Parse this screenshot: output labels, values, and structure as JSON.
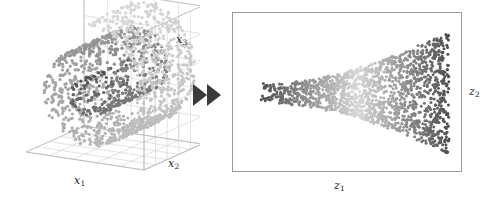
{
  "figure": {
    "caption": "",
    "background_color": "#ffffff",
    "width": 497,
    "height": 204
  },
  "left_panel": {
    "name": "swiss-roll-3d-scatter",
    "projection": "3d",
    "box_color": "#b9b9b9",
    "grid_color": "#cfcfcf",
    "axis_labels": {
      "x1": "x",
      "x1_sub": "1",
      "x2": "x",
      "x2_sub": "2",
      "x3": "x",
      "x3_sub": "3"
    }
  },
  "transition": {
    "name": "double-right-arrow",
    "glyph": "▶▶",
    "color": "#3a3a3a"
  },
  "right_panel": {
    "name": "unrolled-embedding-2d",
    "projection": "2d",
    "frame_color": "#9a9a9a",
    "axis_labels": {
      "z1": "z",
      "z1_sub": "1",
      "z2": "z",
      "z2_sub": "2"
    }
  },
  "chart_data": [
    {
      "id": "swiss-roll-3d",
      "type": "scatter",
      "title": "",
      "xlabel": "x1",
      "ylabel": "x2",
      "zlabel": "x3",
      "projection": "3d",
      "grid": true,
      "legend": false,
      "colormap": "grayscale",
      "colormap_range": [
        "#4a4a4a",
        "#d8d8d8"
      ],
      "point_count": 1600,
      "point_size": 1.6,
      "description": "Swiss roll manifold: a two-dimensional sheet rolled into a spiral in three dimensions. Colour encodes position along the unrolled intrinsic coordinate, running from dark at the inner end of the spiral to light at the outer end.",
      "manifold": {
        "kind": "swiss-roll",
        "t_range": [
          1.5708,
          14.1372
        ],
        "height_range": [
          0,
          21
        ],
        "radius_formula": "r = t",
        "turns": 2.0
      },
      "axis_ranges": {
        "x1": [
          -12,
          14
        ],
        "x2": [
          0,
          21
        ],
        "x3": [
          -14,
          14
        ]
      },
      "grid_divisions": {
        "x1": 5,
        "x2": 5,
        "x3": 5
      }
    },
    {
      "id": "unrolled-embedding-2d",
      "type": "scatter",
      "title": "",
      "xlabel": "z1",
      "ylabel": "z2",
      "projection": "2d",
      "grid": false,
      "legend": false,
      "colormap": "grayscale",
      "colormap_range": [
        "#4a4a4a",
        "#d8d8d8"
      ],
      "point_count": 1600,
      "point_size": 1.5,
      "description": "Two-dimensional embedding recovered from the Swiss roll. The sheet appears as a horizontal fan: a narrow dark band on the left that widens and brightens toward the middle and becomes a tall dark band at the right.",
      "shape": {
        "kind": "horizontal-fan",
        "left_half_height": 9,
        "right_half_height": 62,
        "x_span": [
          0,
          1
        ]
      },
      "axis_ranges": {
        "z1": [
          0,
          1
        ],
        "z2": [
          -1,
          1
        ]
      }
    }
  ]
}
